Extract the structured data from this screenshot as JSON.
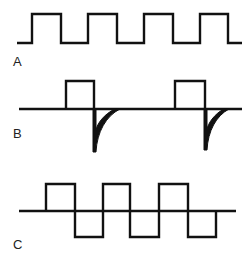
{
  "diagram": {
    "type": "waveform-comparison",
    "stroke_color": "#111111",
    "background": "#ffffff",
    "panels": [
      {
        "id": "A",
        "label": "A",
        "description": "Unipolar square pulse train",
        "baseline_y": 43,
        "high_y": 14,
        "pulses": [
          [
            32,
            61
          ],
          [
            88,
            117
          ],
          [
            144,
            173
          ],
          [
            200,
            228
          ]
        ]
      },
      {
        "id": "B",
        "label": "B",
        "description": "Pulse with negative exponential undershoot spike",
        "baseline_y": 109,
        "high_y": 81,
        "spike_y": 151,
        "pulses": [
          [
            66,
            94
          ],
          [
            175,
            205
          ]
        ]
      },
      {
        "id": "C",
        "label": "C",
        "description": "Bipolar square wave",
        "baseline_y": 211,
        "high_y": 184,
        "low_y": 237,
        "transitions": [
          46,
          75,
          103,
          130,
          159,
          188,
          216
        ]
      }
    ]
  }
}
